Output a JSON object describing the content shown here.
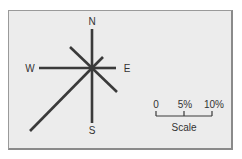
{
  "diagram": {
    "type": "wind-rose",
    "center": [
      92,
      68
    ],
    "line_color": "#3a3a3a",
    "background": "#ececec",
    "directions": [
      {
        "label": "N",
        "end": [
          92,
          29
        ],
        "label_pos": [
          92,
          25
        ]
      },
      {
        "label": "E",
        "end": [
          116,
          68
        ],
        "label_pos": [
          127,
          72
        ]
      },
      {
        "label": "S",
        "end": [
          92,
          123
        ],
        "label_pos": [
          92,
          134
        ]
      },
      {
        "label": "W",
        "end": [
          39,
          68
        ],
        "label_pos": [
          30,
          72
        ]
      }
    ],
    "spokes": [
      {
        "name": "N",
        "end": [
          92,
          29
        ]
      },
      {
        "name": "NE",
        "end": [
          103,
          57
        ]
      },
      {
        "name": "E",
        "end": [
          116,
          68
        ]
      },
      {
        "name": "SE",
        "end": [
          117,
          92
        ]
      },
      {
        "name": "S",
        "end": [
          92,
          123
        ]
      },
      {
        "name": "SW",
        "end": [
          30,
          131
        ]
      },
      {
        "name": "W",
        "end": [
          39,
          68
        ]
      },
      {
        "name": "NW",
        "end": [
          70,
          47
        ]
      }
    ],
    "scale": {
      "title": "Scale",
      "ticks": [
        "0",
        "5%",
        "10%"
      ],
      "bar_x": [
        156,
        212
      ],
      "bar_y": 116
    }
  }
}
